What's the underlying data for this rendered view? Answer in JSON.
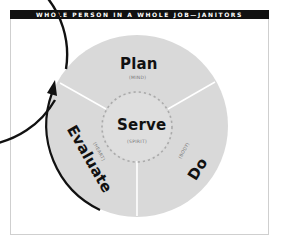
{
  "header": {
    "title": "WHOLE PERSON IN A WHOLE JOB—JANITORS"
  },
  "diagram": {
    "colors": {
      "outer_fill": "#d9d9d9",
      "inner_fill": "#dedede",
      "ring_stroke": "#111111",
      "divider": "#ffffff",
      "dashes": "#aaaaaa",
      "header_bg": "#111111",
      "header_text": "#ffffff"
    },
    "center": {
      "label": "Serve",
      "sublabel": "(SPIRIT)"
    },
    "segments": [
      {
        "label": "Plan",
        "sublabel": "(MIND)",
        "position": "top"
      },
      {
        "label": "Do",
        "sublabel": "(BODY)",
        "position": "lower-right"
      },
      {
        "label": "Evaluate",
        "sublabel": "(HEART)",
        "position": "lower-left"
      }
    ],
    "cycle_arrow": "clockwise-arrow"
  }
}
